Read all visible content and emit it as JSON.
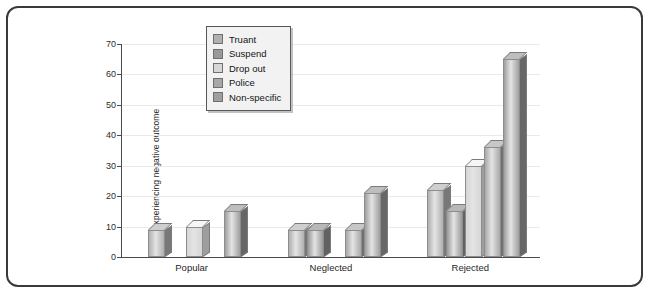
{
  "chart_data": {
    "type": "bar",
    "title": "",
    "subtitle": "",
    "xlabel": "",
    "ylabel": "% experiencing negative outcome",
    "categories": [
      "Popular",
      "Neglected",
      "Rejected"
    ],
    "ylim": [
      0,
      70
    ],
    "yticks": [
      0,
      10,
      20,
      30,
      40,
      50,
      60,
      70
    ],
    "grid": true,
    "legend_position": "upper-left-inside",
    "style": "3d-bars-grayscale",
    "series": [
      {
        "name": "Truant",
        "color": "#b0b0b0",
        "values": [
          9,
          9,
          22
        ]
      },
      {
        "name": "Suspend",
        "color": "#999999",
        "values": [
          null,
          9,
          15
        ]
      },
      {
        "name": "Drop out",
        "color": "#d6d6d6",
        "values": [
          10,
          null,
          30
        ]
      },
      {
        "name": "Police",
        "color": "#a8a8a8",
        "values": [
          null,
          9,
          36
        ]
      },
      {
        "name": "Non-specific",
        "color": "#9f9f9f",
        "values": [
          15,
          21,
          65
        ]
      }
    ]
  },
  "legend": {
    "items": [
      {
        "label": "Truant"
      },
      {
        "label": "Suspend"
      },
      {
        "label": "Drop out"
      },
      {
        "label": "Police"
      },
      {
        "label": "Non-specific"
      }
    ]
  },
  "axis": {
    "y_title": "% experiencing negative outcome",
    "y_tick_labels": [
      "0",
      "10",
      "20",
      "30",
      "40",
      "50",
      "60",
      "70"
    ],
    "x_tick_labels": [
      "Popular",
      "Neglected",
      "Rejected"
    ]
  },
  "colors": {
    "frame_border": "#3a3a3c",
    "axis": "#4a4a4c",
    "gridline": "#e9e9ec",
    "legend_bg": "#f2f2f2",
    "plot_bg": "#ffffff"
  }
}
